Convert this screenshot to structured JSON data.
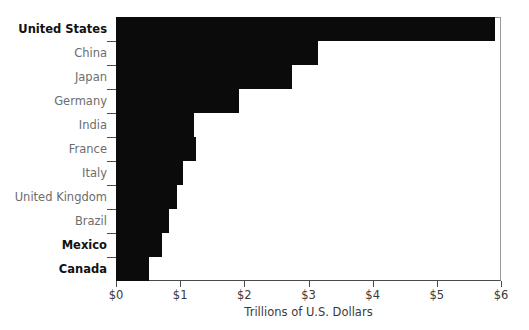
{
  "chart_data": {
    "type": "bar",
    "orientation": "horizontal",
    "title": "",
    "xlabel": "Trillions of U.S. Dollars",
    "ylabel": "",
    "xlim": [
      0,
      6
    ],
    "grid": false,
    "legend": false,
    "bar_color": "#0b0b0b",
    "axis_color": "#4a4a4a",
    "categories": [
      "United States",
      "China",
      "Japan",
      "Germany",
      "India",
      "France",
      "Italy",
      "United Kingdom",
      "Brazil",
      "Mexico",
      "Canada"
    ],
    "values": [
      5.9,
      3.15,
      2.75,
      1.92,
      1.22,
      1.25,
      1.05,
      0.95,
      0.82,
      0.72,
      0.52
    ],
    "emphasized_categories": [
      "United States",
      "Mexico",
      "Canada"
    ],
    "xticks": [
      0,
      1,
      2,
      3,
      4,
      5,
      6
    ],
    "xtick_labels": [
      "$0",
      "$1",
      "$2",
      "$3",
      "$4",
      "$5",
      "$6"
    ]
  }
}
